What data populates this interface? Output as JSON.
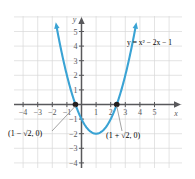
{
  "chart_data": {
    "type": "line",
    "title": "",
    "equation_label": "y = x² − 2x − 1",
    "xlabel": "x",
    "ylabel": "y",
    "xlim": [
      -5,
      6
    ],
    "ylim": [
      -4.5,
      6.2
    ],
    "grid": true,
    "grid_color": "#d9d9d9",
    "axis_color": "#58585b",
    "curve_color": "#3aa3d4",
    "point_color": "#231f20",
    "label_color": "#3aa3d4",
    "legend_position": "none",
    "x_ticks": [
      -4,
      -3,
      -2,
      -1,
      1,
      2,
      3,
      4,
      5
    ],
    "x_tick_labels": [
      "−4",
      "−3",
      "−2",
      "−1",
      "1",
      "2",
      "3",
      "4",
      "5"
    ],
    "y_ticks": [
      5,
      4,
      3,
      2,
      1,
      -1,
      -2,
      -3,
      -4
    ],
    "y_tick_labels": [
      "5",
      "4",
      "3",
      "2",
      "1",
      "−1",
      "−2",
      "−3",
      "−4"
    ],
    "function": "y = x^2 - 2x - 1",
    "vertex": [
      1,
      -2
    ],
    "roots": [
      -0.414213562,
      2.414213562
    ],
    "annotations": [
      {
        "name": "left-root",
        "text": "(1 − √2, 0)",
        "point": [
          -0.414213562,
          0
        ]
      },
      {
        "name": "right-root",
        "text": "(1 + √2, 0)",
        "point": [
          2.414213562,
          0
        ]
      }
    ],
    "series": [
      {
        "name": "y = x^2 - 2x - 1",
        "x": [
          -1.7,
          -1.5,
          -1.25,
          -1.0,
          -0.75,
          -0.5,
          -0.25,
          0,
          0.25,
          0.5,
          0.75,
          1.0,
          1.25,
          1.5,
          1.75,
          2.0,
          2.25,
          2.5,
          2.75,
          3.0,
          3.25,
          3.5,
          3.7
        ],
        "y": [
          5.29,
          4.25,
          3.0625,
          2.0,
          1.0625,
          0.25,
          -0.4375,
          -1.0,
          -1.4375,
          -1.75,
          -1.9375,
          -2.0,
          -1.9375,
          -1.75,
          -1.4375,
          -1.0,
          -0.4375,
          0.25,
          1.0625,
          2.0,
          3.0625,
          4.25,
          5.29
        ]
      }
    ]
  },
  "figure": {
    "x_axis_name": "x",
    "y_axis_name": "y"
  }
}
